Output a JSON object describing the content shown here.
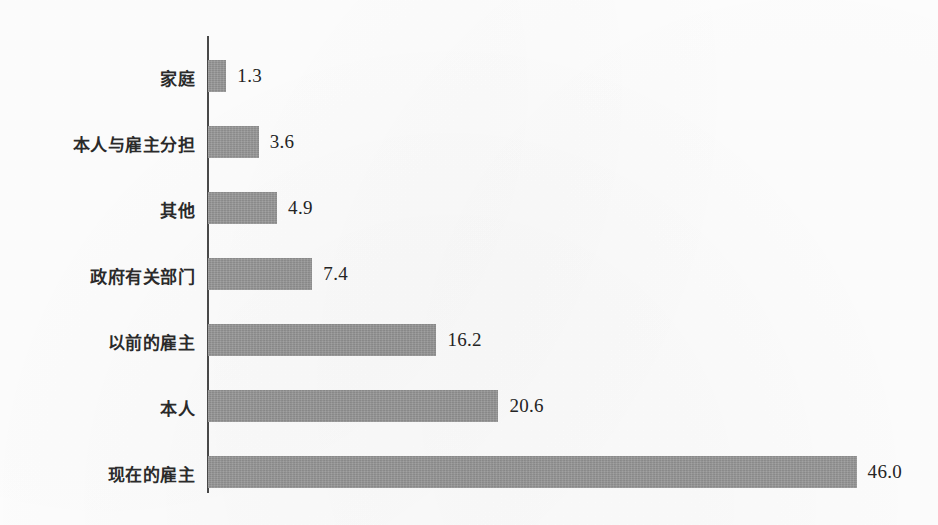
{
  "chart_data": {
    "type": "bar",
    "orientation": "horizontal",
    "title": "",
    "subtitle": "",
    "xlabel": "",
    "ylabel": "",
    "grid": false,
    "legend": null,
    "axis_visible": {
      "x": false,
      "y": true
    },
    "xlim": [
      0,
      46.0
    ],
    "categories": [
      "家庭",
      "本人与雇主分担",
      "其他",
      "政府有关部门",
      "以前的雇主",
      "本人",
      "现在的雇主"
    ],
    "values": [
      1.3,
      3.6,
      4.9,
      7.4,
      16.2,
      20.6,
      46.0
    ],
    "value_labels": [
      "1.3",
      "3.6",
      "4.9",
      "7.4",
      "16.2",
      "20.6",
      "46.0"
    ],
    "bar_color": "#9b9b9b",
    "axis_color": "#4a4a4a",
    "background_color": "#fefefe",
    "text_color": "#2b2b2b"
  },
  "geometry": {
    "axis_x": 207,
    "axis_top": 36,
    "axis_bottom": 493,
    "bar_start_x": 208,
    "px_per_unit": 14.1,
    "bar_height": 32,
    "row_pitch": 66,
    "first_row_top": 60,
    "label_gap": 11
  }
}
